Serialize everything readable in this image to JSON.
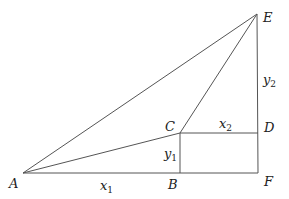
{
  "diagram": {
    "type": "geometry",
    "points": {
      "A": {
        "label": "A",
        "x": 23,
        "y": 173
      },
      "B": {
        "label": "B",
        "x": 180,
        "y": 173
      },
      "C": {
        "label": "C",
        "x": 180,
        "y": 133
      },
      "D": {
        "label": "D",
        "x": 258,
        "y": 133
      },
      "E": {
        "label": "E",
        "x": 257,
        "y": 14
      },
      "F": {
        "label": "F",
        "x": 258,
        "y": 173
      }
    },
    "segments": [
      [
        "A",
        "B"
      ],
      [
        "B",
        "F"
      ],
      [
        "A",
        "C"
      ],
      [
        "A",
        "E"
      ],
      [
        "C",
        "E"
      ],
      [
        "C",
        "D"
      ],
      [
        "B",
        "C"
      ],
      [
        "D",
        "F"
      ],
      [
        "E",
        "D"
      ]
    ],
    "length_labels": {
      "x1": {
        "base": "x",
        "sub": "1"
      },
      "x2": {
        "base": "x",
        "sub": "2"
      },
      "y1": {
        "base": "y",
        "sub": "1"
      },
      "y2": {
        "base": "y",
        "sub": "2"
      }
    },
    "stroke_color": "#555555"
  }
}
